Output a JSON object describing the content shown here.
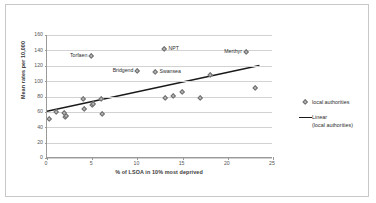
{
  "chart_data": {
    "type": "scatter",
    "title": "",
    "xlabel": "% of LSOA in 10% most deprived",
    "ylabel": "Mean rates per 10,000",
    "xlim": [
      0,
      25
    ],
    "ylim": [
      0,
      160
    ],
    "xticks": [
      "0",
      "5",
      "10",
      "15",
      "20",
      "25"
    ],
    "yticks": [
      "0",
      "20",
      "40",
      "60",
      "80",
      "100",
      "120",
      "140",
      "160"
    ],
    "grid": "horizontal",
    "legend_position": "right",
    "series": [
      {
        "name": "local authorities",
        "marker": "diamond",
        "color": "#b9b9b9",
        "points": [
          {
            "x": 0.2,
            "y": 50,
            "label": ""
          },
          {
            "x": 1.0,
            "y": 60,
            "label": ""
          },
          {
            "x": 1.9,
            "y": 58,
            "label": ""
          },
          {
            "x": 2.0,
            "y": 53,
            "label": ""
          },
          {
            "x": 2.1,
            "y": 55,
            "label": ""
          },
          {
            "x": 4.0,
            "y": 76,
            "label": ""
          },
          {
            "x": 4.1,
            "y": 64,
            "label": ""
          },
          {
            "x": 4.9,
            "y": 133,
            "label": "Torfaen",
            "label_side": "left"
          },
          {
            "x": 5.0,
            "y": 69,
            "label": ""
          },
          {
            "x": 5.1,
            "y": 70,
            "label": ""
          },
          {
            "x": 6.0,
            "y": 76,
            "label": ""
          },
          {
            "x": 6.1,
            "y": 57,
            "label": ""
          },
          {
            "x": 10.0,
            "y": 113,
            "label": "Bridgend",
            "label_side": "left"
          },
          {
            "x": 12.0,
            "y": 112,
            "label": "Swansea",
            "label_side": "right"
          },
          {
            "x": 13.0,
            "y": 142,
            "label": "NPT",
            "label_side": "right"
          },
          {
            "x": 13.1,
            "y": 78,
            "label": ""
          },
          {
            "x": 14.0,
            "y": 81,
            "label": ""
          },
          {
            "x": 15.0,
            "y": 86,
            "label": ""
          },
          {
            "x": 17.0,
            "y": 78,
            "label": ""
          },
          {
            "x": 18.0,
            "y": 108,
            "label": ""
          },
          {
            "x": 22.0,
            "y": 138,
            "label": "Merthyr",
            "label_side": "left"
          },
          {
            "x": 23.0,
            "y": 91,
            "label": ""
          }
        ]
      }
    ],
    "trendline": {
      "name": "Linear (local authorities)",
      "color": "#1a1a1a",
      "x_start": 0,
      "y_start": 60,
      "x_end": 23.6,
      "y_end": 120
    }
  },
  "legend": {
    "items": [
      {
        "key": "diamond",
        "label": "local authorities"
      },
      {
        "key": "line",
        "label_line1": "Linear",
        "label_line2": "(local authorities)"
      }
    ]
  }
}
